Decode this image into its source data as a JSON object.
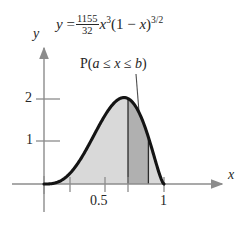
{
  "figure": {
    "equation": {
      "lhs": "y",
      "equals": "=",
      "fraction_numerator": "1155",
      "fraction_denominator": "32",
      "variable": "x",
      "exponent": "3",
      "factor_open": "(1",
      "minus": "−",
      "factor_var": "x",
      "factor_close": ")",
      "factor_exponent": "3/2",
      "full_text": "y = (1155/32) x^3 (1 - x)^(3/2)"
    },
    "axis_labels": {
      "y": "y",
      "x": "x"
    },
    "annotation": {
      "text": "P(a ≤ x ≤ b)",
      "prefix": "P(",
      "lower": "a",
      "le1": "≤",
      "variable": "x",
      "le2": "≤",
      "upper": "b",
      "suffix": ")"
    },
    "colors": {
      "curve": "#141414",
      "axis": "#8c8c8c",
      "shade_light": "#d9d9d9",
      "shade_dark": "#b0b0b0",
      "text": "#262626",
      "background": "#ffffff"
    }
  },
  "chart_data": {
    "type": "area",
    "title": "",
    "xlabel": "x",
    "ylabel": "y",
    "xlim": [
      0,
      1.22
    ],
    "ylim": [
      0,
      2.38
    ],
    "grid": false,
    "legend": null,
    "function": "y = (1155/32) * x^3 * (1 - x)^(3/2)",
    "xticks": [
      0,
      0.2,
      0.5,
      0.7,
      1
    ],
    "xtick_labels": [
      "",
      "",
      "0.5",
      "",
      "1"
    ],
    "yticks": [
      1,
      2
    ],
    "ytick_labels": [
      "1",
      "2"
    ],
    "shaded_region": {
      "label": "P(a ≤ x ≤ b)",
      "full_area_from": 0,
      "full_area_to": 1,
      "band_from": 0.7,
      "band_to": 0.87
    },
    "x": [
      0,
      0.05,
      0.1,
      0.15,
      0.2,
      0.25,
      0.3,
      0.35,
      0.4,
      0.45,
      0.5,
      0.55,
      0.6,
      0.65,
      0.7,
      0.75,
      0.8,
      0.85,
      0.9,
      0.95,
      1
    ],
    "values": [
      0,
      0.004,
      0.031,
      0.101,
      0.23,
      0.428,
      0.697,
      1.028,
      1.404,
      1.795,
      2.164,
      2.467,
      2.661,
      2.707,
      2.578,
      2.259,
      1.76,
      1.125,
      0.475,
      0.055,
      0
    ]
  }
}
